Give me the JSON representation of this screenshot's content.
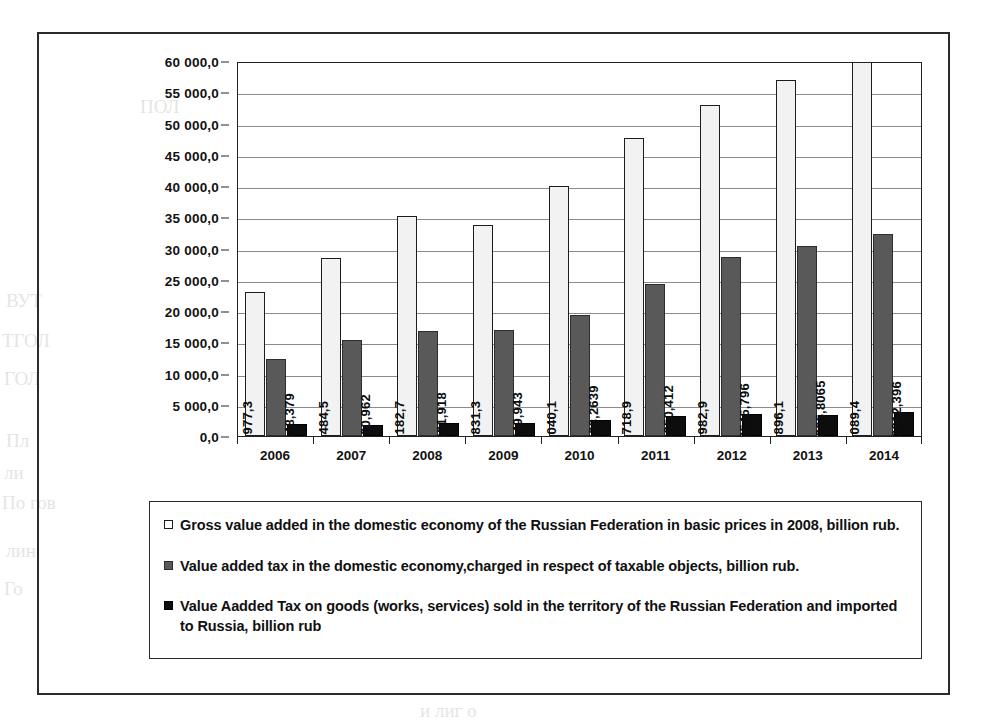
{
  "chart_data": {
    "type": "bar",
    "title": "",
    "subtitle": "",
    "xlabel": "",
    "ylabel": "",
    "grid": true,
    "legend_position": "bottom",
    "ylim": [
      0,
      60000
    ],
    "ytick_step": 5000,
    "categories": [
      "2006",
      "2007",
      "2008",
      "2009",
      "2010",
      "2011",
      "2012",
      "2013",
      "2014"
    ],
    "ytick_labels": [
      "60 000,0",
      "55 000,0",
      "50 000,0",
      "45 000,0",
      "40 000,0",
      "35 000,0",
      "30 000,0",
      "25 000,0",
      "20 000,0",
      "15 000,0",
      "10 000,0",
      "5 000,0",
      "0,0"
    ],
    "series": [
      {
        "name": "Gross value added in the domestic economy of the Russian Federation in basic prices in 2008, billion rub.",
        "marker": "hollow-square",
        "color": "#f2f2f2",
        "values": [
          22977.3,
          28484.5,
          35182.7,
          33831.3,
          40040.1,
          47718.9,
          52982.9,
          56896.1,
          61089.4
        ],
        "labels": [
          "22 977,3",
          "28 484,5",
          "35 182,7",
          "33 831,3",
          "40 040,1",
          "47 718,9",
          "52 982,9",
          "56 896,1",
          "61 089,4"
        ]
      },
      {
        "name": "Value added tax in the domestic economy,charged in respect of taxable objects,  billion rub.",
        "marker": "gray-square",
        "color": "#595959",
        "values": [
          12400,
          15400,
          16800,
          17000,
          19400,
          24400,
          28700,
          30400,
          32400
        ],
        "labels": [
          "",
          "",
          "",
          "",
          "",
          "",
          "",
          "",
          ""
        ]
      },
      {
        "name": "Value Aadded Tax on goods (works, services) sold in the territory of the Russian Federation and imported to Russia, billion  rub",
        "marker": "black-square",
        "color": "#0d0d0d",
        "values": [
          1848.379,
          1760.962,
          2091.918,
          2049.943,
          2498.2639,
          3250.412,
          3545.796,
          3365.8065,
          3812.396
        ],
        "labels": [
          "1848,379",
          "1760,962",
          "2091,918",
          "2049,943",
          "2498,2639",
          "3250,412",
          "3545,796",
          "3365,8065",
          "3812,396"
        ]
      }
    ]
  },
  "legend": {
    "entries": [
      {
        "marker": "hollow-square",
        "label": "Gross value added in the domestic economy of the Russian Federation in basic prices in 2008, billion rub."
      },
      {
        "marker": "gray-square",
        "label": "Value added tax in the domestic economy,charged in respect of taxable objects,  billion rub."
      },
      {
        "marker": "black-square",
        "label": "Value Aadded Tax on goods (works, services) sold in the territory of the Russian Federation and imported to Russia, billion  rub"
      }
    ]
  },
  "colors": {
    "series1": "#f2f2f2",
    "series2": "#595959",
    "series3": "#0d0d0d",
    "frame": "#2b2b2b",
    "gridline": "#8b8b8b",
    "text": "#101010"
  }
}
